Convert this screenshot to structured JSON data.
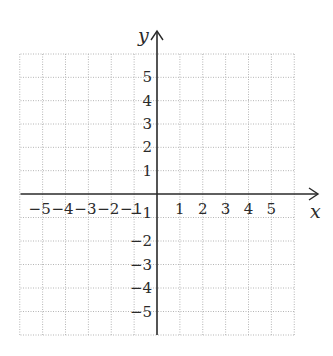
{
  "chart_data": {
    "type": "coordinate-grid",
    "title": "",
    "xlabel": "x",
    "ylabel": "y",
    "xlim": [
      -6,
      6
    ],
    "ylim": [
      -6,
      6
    ],
    "grid": true,
    "grid_style": "dotted",
    "x_ticks": [
      -5,
      -4,
      -3,
      -2,
      -1,
      1,
      2,
      3,
      4,
      5
    ],
    "y_ticks": [
      5,
      4,
      3,
      2,
      1,
      -1,
      -2,
      -3,
      -4,
      -5
    ],
    "x_tick_labels": [
      "−5",
      "−4",
      "−3",
      "−2",
      "−1",
      "1",
      "2",
      "3",
      "4",
      "5"
    ],
    "y_tick_labels": [
      "5",
      "4",
      "3",
      "2",
      "1",
      "−1",
      "−2",
      "−3",
      "−4",
      "−5"
    ],
    "x_axis_arrow": "right",
    "y_axis_arrow": "up",
    "series": []
  },
  "colors": {
    "axis": "#2a2a2a",
    "grid": "#b5b5b5",
    "background": "#ffffff"
  }
}
